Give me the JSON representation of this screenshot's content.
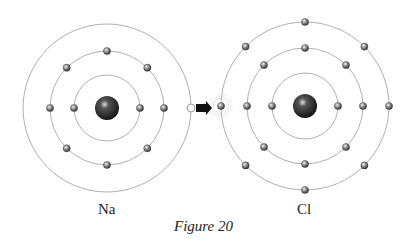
{
  "figure": {
    "caption": "Figure 20"
  },
  "atoms": [
    {
      "symbol": "Na",
      "label": "Na",
      "nucleus": {
        "cx": 107,
        "cy": 108,
        "r": 12
      },
      "shells": [
        {
          "r": 33,
          "electrons": 2,
          "angles": [
            0,
            180
          ]
        },
        {
          "r": 57,
          "electrons": 8,
          "angles": [
            0,
            45,
            90,
            135,
            180,
            225,
            270,
            315
          ]
        },
        {
          "r": 84,
          "electrons": 0,
          "angles": []
        }
      ],
      "vacancy": {
        "shell": 3,
        "angle": 0,
        "note": "empty position (electron given up)"
      }
    },
    {
      "symbol": "Cl",
      "label": "Cl",
      "nucleus": {
        "cx": 305,
        "cy": 106,
        "r": 12
      },
      "shells": [
        {
          "r": 33,
          "electrons": 2,
          "angles": [
            0,
            180
          ]
        },
        {
          "r": 58,
          "electrons": 8,
          "angles": [
            0,
            45,
            90,
            135,
            180,
            225,
            270,
            315
          ]
        },
        {
          "r": 84,
          "electrons": 8,
          "angles": [
            0,
            45,
            90,
            135,
            180,
            225,
            270,
            315
          ]
        }
      ],
      "gained_electron": {
        "shell": 3,
        "angle": 180,
        "highlight": "starburst"
      }
    }
  ],
  "arrow": {
    "direction": "right",
    "x1": 196,
    "x2": 212,
    "y": 108,
    "color": "#111111"
  },
  "colors": {
    "orbit": "#9a9a9a",
    "electron": "#555555",
    "nucleus": "#1a1a1a",
    "background": "#ffffff"
  }
}
